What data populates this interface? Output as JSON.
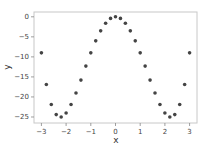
{
  "chart_data": {
    "type": "scatter",
    "title": "",
    "xlabel": "x",
    "ylabel": "y",
    "xlim": [
      -3.3,
      3.3
    ],
    "ylim": [
      -26.5,
      1.2
    ],
    "xticks": [
      -3,
      -2,
      -1,
      0,
      1,
      2,
      3
    ],
    "yticks": [
      0,
      -5,
      -10,
      -15,
      -20,
      -25
    ],
    "grid": false,
    "legend": null,
    "marker_color": "#444444",
    "series": [
      {
        "name": "y",
        "x": [
          -3.0,
          -2.8,
          -2.6,
          -2.4,
          -2.2,
          -2.0,
          -1.8,
          -1.6,
          -1.4,
          -1.2,
          -1.0,
          -0.8,
          -0.6,
          -0.4,
          -0.2,
          0.0,
          0.2,
          0.4,
          0.6,
          0.8,
          1.0,
          1.2,
          1.4,
          1.6,
          1.8,
          2.0,
          2.2,
          2.4,
          2.6,
          2.8,
          3.0
        ],
        "y": [
          -9.0,
          -16.9,
          -21.9,
          -24.4,
          -25.0,
          -24.0,
          -21.9,
          -19.0,
          -15.8,
          -12.3,
          -9.0,
          -6.0,
          -3.5,
          -1.6,
          -0.4,
          0.0,
          -0.4,
          -1.6,
          -3.5,
          -6.0,
          -9.0,
          -12.3,
          -15.8,
          -19.0,
          -21.9,
          -24.0,
          -25.0,
          -24.4,
          -21.9,
          -16.9,
          -9.0
        ]
      }
    ]
  }
}
